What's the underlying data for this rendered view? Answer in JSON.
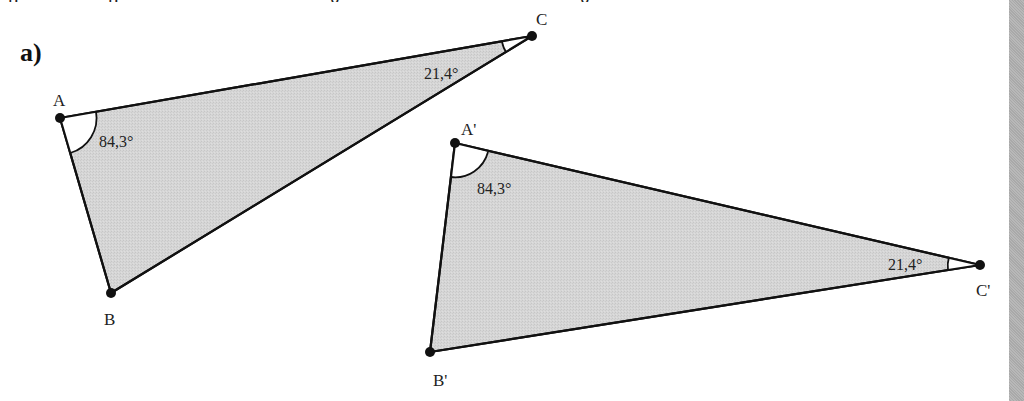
{
  "header": {
    "cutoff_text_fragments": [
      "p",
      "p",
      "g",
      "g"
    ]
  },
  "part_label": "a)",
  "colors": {
    "fill": "#d4d4d4",
    "stroke": "#111111",
    "angle_arc_fill": "#ffffff",
    "side_strip": "#b0b0b0"
  },
  "triangles": [
    {
      "name": "ABC",
      "vertices": {
        "A": {
          "label": "A",
          "x": 60,
          "y": 118
        },
        "B": {
          "label": "B",
          "x": 111,
          "y": 293
        },
        "C": {
          "label": "C",
          "x": 532,
          "y": 36
        }
      },
      "angles": {
        "A": {
          "label": "84,3°"
        },
        "C": {
          "label": "21,4°"
        }
      }
    },
    {
      "name": "A'B'C'",
      "vertices": {
        "A": {
          "label": "A'",
          "x": 455,
          "y": 143
        },
        "B": {
          "label": "B'",
          "x": 430,
          "y": 352
        },
        "C": {
          "label": "C'",
          "x": 980,
          "y": 265
        }
      },
      "angles": {
        "A": {
          "label": "84,3°"
        },
        "C": {
          "label": "21,4°"
        }
      }
    }
  ]
}
